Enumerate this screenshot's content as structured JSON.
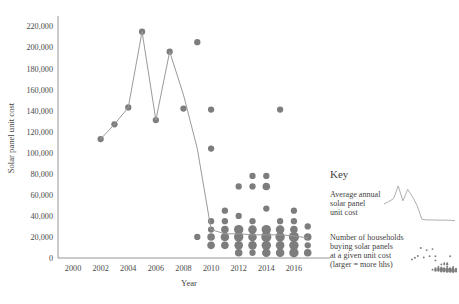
{
  "chart": {
    "title": "",
    "ylabel": "Solar panel unit cost",
    "xlabel": "Year",
    "y_ticks": [
      "0",
      "20,000",
      "40,000",
      "60,000",
      "80,000",
      "100,000",
      "120,000",
      "140,000",
      "160,000",
      "180,000",
      "200,000",
      "220,000"
    ],
    "x_ticks": [
      "2000",
      "2002",
      "2004",
      "2006",
      "2008",
      "2010",
      "2012",
      "2014",
      "2016"
    ]
  },
  "key": {
    "title": "Key",
    "line_label": "Average annual\nsolar panel\nunit cost",
    "line_label_l1": "Average annual",
    "line_label_l2": "solar panel",
    "line_label_l3": "unit cost",
    "scatter_label_l1": "Number of households",
    "scatter_label_l2": "buying solar panels",
    "scatter_label_l3": " at a given unit cost",
    "scatter_label_l4": "(larger = more hhs)"
  },
  "colors": {
    "line": "#9a9a9a",
    "dot": "#7d7d7d",
    "axis": "#8a8a8a",
    "text": "#3f3f3f",
    "background": "#ffffff"
  },
  "chart_data": {
    "type": "scatter",
    "xlabel": "Year",
    "ylabel": "Solar panel unit cost",
    "xlim": [
      1999.2,
      2017.6
    ],
    "ylim": [
      0,
      228000
    ],
    "grid": false,
    "legend_position": "right",
    "series": [
      {
        "name": "Average annual solar panel unit cost",
        "type": "line",
        "x": [
          2002,
          2003,
          2004,
          2005,
          2006,
          2007,
          2008,
          2009,
          2010,
          2011,
          2012,
          2013,
          2014,
          2015,
          2016,
          2017
        ],
        "y": [
          113000,
          127000,
          143000,
          215000,
          131000,
          196000,
          155000,
          104000,
          27000,
          23000,
          23000,
          22000,
          22000,
          22000,
          21000,
          19000
        ]
      },
      {
        "name": "Number of households buying solar panels at a given unit cost (larger = more hhs)",
        "type": "bubble",
        "note": "marker area proportional to number of households",
        "points": [
          {
            "x": 2002,
            "y": 113000,
            "size": 1
          },
          {
            "x": 2003,
            "y": 127000,
            "size": 1
          },
          {
            "x": 2004,
            "y": 143000,
            "size": 1
          },
          {
            "x": 2005,
            "y": 215000,
            "size": 1
          },
          {
            "x": 2006,
            "y": 131000,
            "size": 1
          },
          {
            "x": 2007,
            "y": 196000,
            "size": 1
          },
          {
            "x": 2008,
            "y": 142000,
            "size": 1
          },
          {
            "x": 2009,
            "y": 205000,
            "size": 1
          },
          {
            "x": 2010,
            "y": 141000,
            "size": 1
          },
          {
            "x": 2010,
            "y": 104000,
            "size": 1
          },
          {
            "x": 2015,
            "y": 141000,
            "size": 1
          },
          {
            "x": 2013,
            "y": 78000,
            "size": 1
          },
          {
            "x": 2014,
            "y": 78000,
            "size": 1
          },
          {
            "x": 2012,
            "y": 68000,
            "size": 1
          },
          {
            "x": 2013,
            "y": 68000,
            "size": 1
          },
          {
            "x": 2014,
            "y": 68000,
            "size": 2
          },
          {
            "x": 2011,
            "y": 45000,
            "size": 1
          },
          {
            "x": 2012,
            "y": 40000,
            "size": 1
          },
          {
            "x": 2010,
            "y": 35000,
            "size": 1
          },
          {
            "x": 2011,
            "y": 35000,
            "size": 1
          },
          {
            "x": 2013,
            "y": 35000,
            "size": 1
          },
          {
            "x": 2010,
            "y": 27000,
            "size": 1
          },
          {
            "x": 2011,
            "y": 27000,
            "size": 2
          },
          {
            "x": 2012,
            "y": 27000,
            "size": 4
          },
          {
            "x": 2013,
            "y": 27000,
            "size": 3
          },
          {
            "x": 2014,
            "y": 27000,
            "size": 4
          },
          {
            "x": 2015,
            "y": 27000,
            "size": 3
          },
          {
            "x": 2016,
            "y": 27000,
            "size": 2
          },
          {
            "x": 2009,
            "y": 20000,
            "size": 1
          },
          {
            "x": 2010,
            "y": 20000,
            "size": 2
          },
          {
            "x": 2011,
            "y": 20000,
            "size": 3
          },
          {
            "x": 2012,
            "y": 20000,
            "size": 4
          },
          {
            "x": 2013,
            "y": 20000,
            "size": 3
          },
          {
            "x": 2014,
            "y": 20000,
            "size": 5
          },
          {
            "x": 2015,
            "y": 20000,
            "size": 4
          },
          {
            "x": 2016,
            "y": 20000,
            "size": 5
          },
          {
            "x": 2017,
            "y": 20000,
            "size": 2
          },
          {
            "x": 2010,
            "y": 12000,
            "size": 2
          },
          {
            "x": 2011,
            "y": 12000,
            "size": 2
          },
          {
            "x": 2012,
            "y": 12000,
            "size": 3
          },
          {
            "x": 2013,
            "y": 12000,
            "size": 3
          },
          {
            "x": 2014,
            "y": 12000,
            "size": 4
          },
          {
            "x": 2015,
            "y": 12000,
            "size": 3
          },
          {
            "x": 2016,
            "y": 12000,
            "size": 4
          },
          {
            "x": 2017,
            "y": 12000,
            "size": 1
          },
          {
            "x": 2012,
            "y": 5000,
            "size": 2
          },
          {
            "x": 2013,
            "y": 5000,
            "size": 1
          },
          {
            "x": 2014,
            "y": 5000,
            "size": 3
          },
          {
            "x": 2015,
            "y": 5000,
            "size": 3
          },
          {
            "x": 2016,
            "y": 5000,
            "size": 4
          },
          {
            "x": 2017,
            "y": 5000,
            "size": 2
          },
          {
            "x": 2014,
            "y": 47000,
            "size": 1
          },
          {
            "x": 2016,
            "y": 45000,
            "size": 1
          },
          {
            "x": 2015,
            "y": 35000,
            "size": 1
          },
          {
            "x": 2016,
            "y": 35000,
            "size": 1
          },
          {
            "x": 2017,
            "y": 30000,
            "size": 1
          }
        ]
      }
    ]
  }
}
